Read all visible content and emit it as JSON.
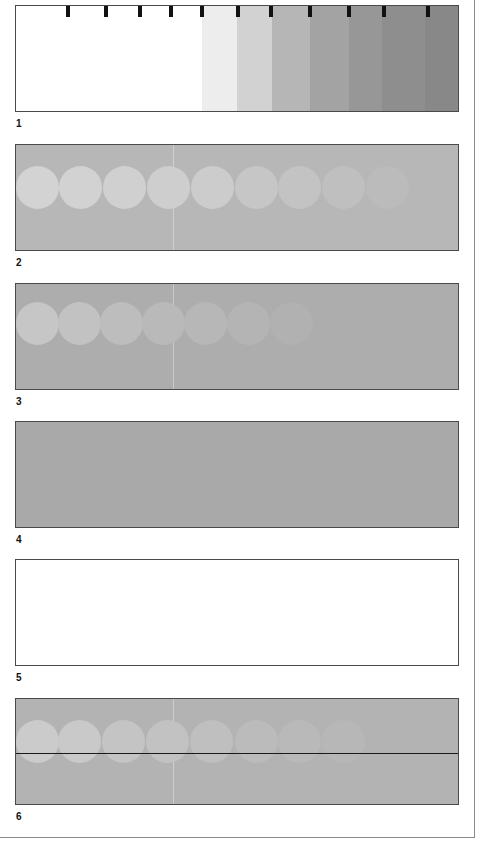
{
  "figure": {
    "panels": [
      {
        "label": "1",
        "description": "Grayscale step wedge with tick marks",
        "top": 5,
        "background": "#ffffff",
        "ticks_x": [
          50,
          88,
          122,
          153,
          184,
          220,
          253,
          292,
          331,
          366,
          410
        ],
        "bands": [
          {
            "x": 0,
            "w": 186,
            "color": "#ffffff"
          },
          {
            "x": 186,
            "w": 35,
            "color": "#ededed"
          },
          {
            "x": 221,
            "w": 35,
            "color": "#d2d2d2"
          },
          {
            "x": 256,
            "w": 38,
            "color": "#b6b6b6"
          },
          {
            "x": 294,
            "w": 39,
            "color": "#a3a3a3"
          },
          {
            "x": 333,
            "w": 33,
            "color": "#979797"
          },
          {
            "x": 366,
            "w": 43,
            "color": "#8e8e8e"
          },
          {
            "x": 409,
            "w": 35,
            "color": "#888888"
          }
        ]
      },
      {
        "label": "2",
        "description": "Gray field with row of fading light circles",
        "top": 144,
        "background": "#b7b7b7",
        "circle_y": 33,
        "circles": [
          {
            "x": 0,
            "color": "#d3d3d3"
          },
          {
            "x": 43,
            "color": "#d2d2d2"
          },
          {
            "x": 87,
            "color": "#d0d0d0"
          },
          {
            "x": 131,
            "color": "#cecece"
          },
          {
            "x": 175,
            "color": "#cccccc"
          },
          {
            "x": 219,
            "color": "#c6c6c6"
          },
          {
            "x": 262,
            "color": "#c3c3c3"
          },
          {
            "x": 306,
            "color": "#bfbfbf"
          },
          {
            "x": 350,
            "color": "#bbbbbb"
          }
        ]
      },
      {
        "label": "3",
        "description": "Darker gray field with fainter fading circles",
        "top": 283,
        "background": "#adadad",
        "circle_y": 30,
        "circles": [
          {
            "x": 0,
            "color": "#c6c6c6"
          },
          {
            "x": 42,
            "color": "#c2c2c2"
          },
          {
            "x": 84,
            "color": "#bdbdbd"
          },
          {
            "x": 126,
            "color": "#b9b9b9"
          },
          {
            "x": 168,
            "color": "#b7b7b7"
          },
          {
            "x": 211,
            "color": "#b4b4b4"
          },
          {
            "x": 254,
            "color": "#b1b1b1"
          }
        ]
      },
      {
        "label": "4",
        "description": "Uniform gray field",
        "top": 421,
        "background": "#a9a9a9",
        "circles": []
      },
      {
        "label": "5",
        "description": "Blank white field",
        "top": 559,
        "background": "#ffffff",
        "circles": []
      },
      {
        "label": "6",
        "description": "Gray field with fading circles bisected by horizontal line",
        "top": 698,
        "background": "#b3b3b3",
        "circle_y": 33,
        "line_y": 54,
        "circles": [
          {
            "x": 0,
            "color": "#cbcbcb"
          },
          {
            "x": 42,
            "color": "#c9c9c9"
          },
          {
            "x": 86,
            "color": "#c4c4c4"
          },
          {
            "x": 130,
            "color": "#c2c2c2"
          },
          {
            "x": 174,
            "color": "#bfbfbf"
          },
          {
            "x": 219,
            "color": "#bbbbbb"
          },
          {
            "x": 262,
            "color": "#b9b9b9"
          },
          {
            "x": 306,
            "color": "#b7b7b7"
          }
        ]
      }
    ]
  }
}
